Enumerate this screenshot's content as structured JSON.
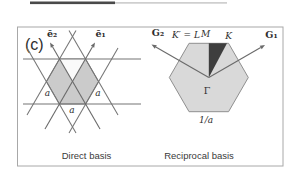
{
  "figure": {
    "panel_label": "(c)",
    "colors": {
      "frame_border": "#a8a8a8",
      "lattice_line": "#757575",
      "direct_cell_fill": "#cbcbcb",
      "direct_wedge_highlight": "#fafafa",
      "reciprocal_zone_fill": "#d9d9d9",
      "irreducible_wedge_fill": "#3e3e3e",
      "text": "#2e2e2e"
    },
    "direct_panel": {
      "caption": "Direct basis",
      "basis_vector_2": "ē₂",
      "basis_vector_1": "ē₁",
      "lattice_constant_labels": [
        "a",
        "a",
        "a"
      ]
    },
    "reciprocal_panel": {
      "caption": "Reciprocal basis",
      "reciprocal_vector_2": "G₂",
      "reciprocal_vector_1": "G₁",
      "kprime_point_label": "K′ = L",
      "m_point_label": "M",
      "k_point_label": "K",
      "gamma_point_label": "Γ",
      "scale_label": "1/a"
    }
  }
}
